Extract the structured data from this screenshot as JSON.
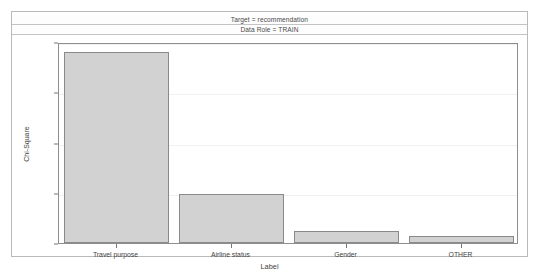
{
  "header": {
    "target_band": "Target = recommendation",
    "data_role_band": "Data Role = TRAIN"
  },
  "chart_data": {
    "type": "bar",
    "title": "",
    "categories": [
      "Travel purpose",
      "Airline status",
      "Gender",
      "OTHER"
    ],
    "values": [
      38100,
      9700,
      2300,
      1400
    ],
    "xlabel": "Label",
    "ylabel": "Chi-Square",
    "ylim": [
      0,
      40000
    ],
    "yticks": [
      0,
      10000,
      20000,
      30000,
      40000
    ],
    "ytick_labels": [
      "0",
      "10000",
      "20000",
      "30000",
      "40000"
    ],
    "grid": true,
    "legend": "none",
    "bar_fill_color": "#d2d2d2",
    "bar_border_color": "#8a8a8a"
  }
}
